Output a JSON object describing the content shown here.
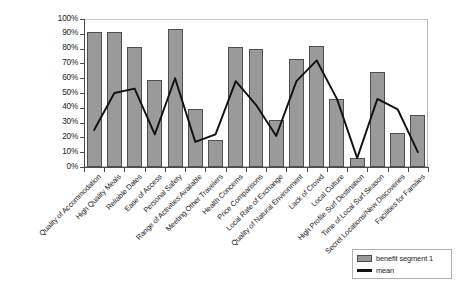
{
  "chart_data": {
    "type": "bar",
    "title": "",
    "xlabel": "",
    "ylabel": "",
    "ylim": [
      0,
      100
    ],
    "ytick_labels": [
      "100%",
      "90%",
      "80%",
      "70%",
      "60%",
      "50%",
      "40%",
      "30%",
      "20%",
      "10%",
      "0%"
    ],
    "ytick_values": [
      100,
      90,
      80,
      70,
      60,
      50,
      40,
      30,
      20,
      10,
      0
    ],
    "grid": false,
    "legend_position": "bottom-right",
    "categories": [
      "Quality of Accommodation",
      "High Quality Meals",
      "Reliable Dates",
      "Ease of Access",
      "Personal Safety",
      "Range of Activities Available",
      "Meeting Other Travelers",
      "Health Concerns",
      "Price Comparisons",
      "Local Rate of Exchange",
      "Quality of Natural Environment",
      "Lack of Crowd",
      "Local Culture",
      "High Profile Surf Destination",
      "Time of Local Surf Season",
      "Secret Locations/New Discoveries",
      "Facilities for Families"
    ],
    "series": [
      {
        "name": "benefit segment 1",
        "render": "bar",
        "color": "#9a9a9a",
        "values": [
          91,
          91,
          81,
          59,
          93,
          39,
          18,
          81,
          80,
          32,
          73,
          82,
          46,
          6,
          64,
          23,
          35
        ]
      },
      {
        "name": "mean",
        "render": "line",
        "color": "#111111",
        "values": [
          25,
          50,
          53,
          22,
          60,
          17,
          22,
          58,
          42,
          21,
          58,
          72,
          46,
          6,
          46,
          39,
          10
        ]
      }
    ]
  },
  "legend": {
    "entries": [
      {
        "label": "benefit segment 1",
        "type": "bar"
      },
      {
        "label": "mean",
        "type": "line"
      }
    ]
  }
}
